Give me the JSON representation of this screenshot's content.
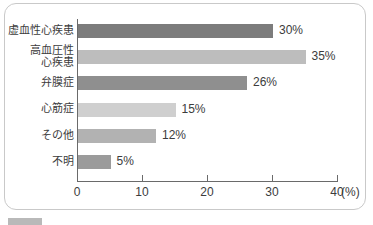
{
  "chart_data": {
    "type": "bar",
    "orientation": "horizontal",
    "title": "",
    "xlabel": "(%)",
    "ylabel": "",
    "categories": [
      "虚血性心疾患",
      "高血圧性\n心疾患",
      "弁膜症",
      "心筋症",
      "その他",
      "不明"
    ],
    "values": [
      30,
      35,
      26,
      15,
      12,
      5
    ],
    "value_labels": [
      "30%",
      "35%",
      "26%",
      "15%",
      "12%",
      "5%"
    ],
    "bar_colors": [
      "#7c7c7c",
      "#bdbdbd",
      "#8f8f8f",
      "#cfcfcf",
      "#b2b2b2",
      "#9b9b9b"
    ],
    "xlim": [
      0,
      40
    ],
    "xticks": [
      0,
      10,
      20,
      30,
      40
    ],
    "xtick_labels": [
      "0",
      "10",
      "20",
      "30",
      "40"
    ],
    "axis_unit": "(%)",
    "grid": false,
    "legend": null
  },
  "caption": {
    "text": "",
    "swatch_color": "#b9b9b9"
  },
  "colors": {
    "panel_border": "#c9c9c9",
    "axis": "#6a6a6a",
    "text": "#3c3c3c",
    "background": "#ffffff"
  }
}
